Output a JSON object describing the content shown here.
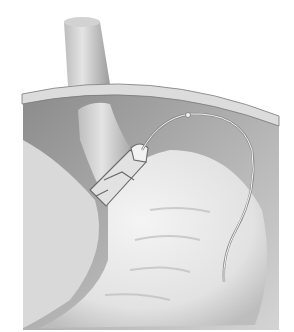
{
  "figure": {
    "colors": {
      "background": "#ffffff",
      "cavity": "#9a9a9a",
      "wall": "#d8d8d8",
      "organ": "#e6e6e6",
      "outline": "#6a6a6a"
    }
  }
}
